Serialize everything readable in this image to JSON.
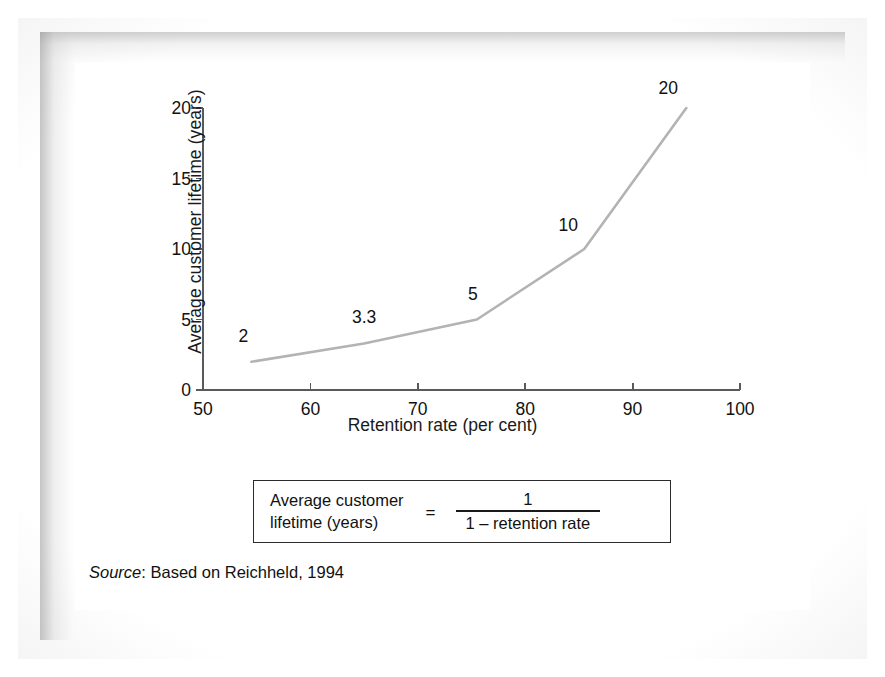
{
  "figure": {
    "source_prefix": "Source",
    "source_text": ": Based on Reichheld, 1994"
  },
  "formula": {
    "lhs_line1": "Average customer",
    "lhs_line2": "lifetime (years)",
    "equals": "=",
    "numerator": "1",
    "denominator": "1 – retention rate"
  },
  "chart_data": {
    "type": "line",
    "title": "",
    "xlabel": "Retention rate (per cent)",
    "ylabel": "Average customer lifetime (years)",
    "xlim": [
      50,
      100
    ],
    "ylim": [
      0,
      20
    ],
    "xticks": [
      "50",
      "60",
      "70",
      "80",
      "90",
      "100"
    ],
    "xtick_values": [
      50,
      60,
      70,
      80,
      90,
      100
    ],
    "yticks": [
      "20",
      "15",
      "10",
      "5",
      "0"
    ],
    "ytick_values": [
      20,
      15,
      10,
      5,
      0
    ],
    "grid": false,
    "legend": false,
    "series": [
      {
        "name": "Average customer lifetime",
        "x": [
          54.5,
          65,
          75.5,
          85.5,
          95
        ],
        "y": [
          2,
          3.3,
          5,
          10,
          20
        ]
      }
    ],
    "point_labels": [
      {
        "text": "2",
        "x": 54.5,
        "y": 2,
        "dx": -8,
        "dy": -26
      },
      {
        "text": "3.3",
        "x": 65,
        "y": 3.3,
        "dx": 0,
        "dy": -26
      },
      {
        "text": "5",
        "x": 75.5,
        "y": 5,
        "dx": -4,
        "dy": -26
      },
      {
        "text": "10",
        "x": 85.5,
        "y": 10,
        "dx": -16,
        "dy": -24
      },
      {
        "text": "20",
        "x": 95,
        "y": 20,
        "dx": -18,
        "dy": -20
      }
    ],
    "line_color": "#b3b3b3",
    "axis_color": "#5a5a5a",
    "text_color": "#111111"
  }
}
